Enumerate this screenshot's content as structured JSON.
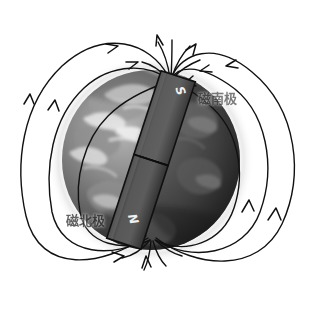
{
  "figure": {
    "background_color": "#ffffff"
  },
  "labels": {
    "magnetic_south_pole": "磁南极",
    "magnetic_north_pole": "磁北极"
  },
  "magnet": {
    "south_pole_letter": "S",
    "north_pole_letter": "N",
    "body_color": "#5a5a5a",
    "edge_color": "#1a1a1a",
    "tilt_degrees": 18
  },
  "globe": {
    "center_x": 151,
    "center_y": 160,
    "radius_x": 89,
    "radius_y": 90,
    "ocean_color": "#6e6e6e",
    "land_color": "#8f8f8f",
    "cloud_color": "#e8e8e8",
    "shadow_color": "#2a2a2a",
    "halo_color": "#f2f2f2"
  },
  "field_lines": {
    "stroke_color": "#111111",
    "stroke_width": 1.4,
    "arrow_color": "#111111",
    "description": "Dipole field lines leaving the magnetic north pole at lower-left and entering the magnetic south pole at upper-right",
    "loop_count": 8
  }
}
